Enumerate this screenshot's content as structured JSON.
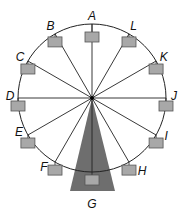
{
  "diagram": {
    "center": {
      "x": 92,
      "y": 98
    },
    "radius": 74,
    "support": {
      "color": "#6e6e6e",
      "base_left_x": 70,
      "base_right_x": 115,
      "base_y": 191
    },
    "gondola_color": "#a8a8a8",
    "points": [
      {
        "label": "A",
        "angle_deg": 90
      },
      {
        "label": "B",
        "angle_deg": 120
      },
      {
        "label": "C",
        "angle_deg": 150
      },
      {
        "label": "D",
        "angle_deg": 180
      },
      {
        "label": "E",
        "angle_deg": 210
      },
      {
        "label": "F",
        "angle_deg": 240
      },
      {
        "label": "G",
        "angle_deg": 270
      },
      {
        "label": "H",
        "angle_deg": 300
      },
      {
        "label": "I",
        "angle_deg": 330
      },
      {
        "label": "J",
        "angle_deg": 0
      },
      {
        "label": "K",
        "angle_deg": 30
      },
      {
        "label": "L",
        "angle_deg": 60
      }
    ]
  }
}
